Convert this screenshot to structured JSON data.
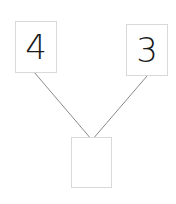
{
  "diagram": {
    "type": "number-bond",
    "left_part": {
      "value": "4"
    },
    "right_part": {
      "value": "3"
    },
    "whole": {
      "value": ""
    },
    "colors": {
      "line": "#8a8a8a",
      "border": "#d9d9d9",
      "text": "#1a1a1a"
    }
  }
}
